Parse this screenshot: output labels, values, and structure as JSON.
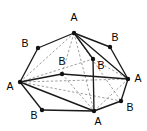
{
  "figure": {
    "width": 147,
    "height": 131,
    "background_color": "#ffffff",
    "solid_edge_color": "#1a1a1a",
    "dashed_edge_color": "#8c8c8c",
    "node_color": "#111111",
    "label_color": "#000000"
  },
  "vertices": [
    {
      "id": "A_top",
      "label": "A",
      "x": 74,
      "y": 33,
      "label_x": 74,
      "label_y": 18,
      "site": "A",
      "position": "top"
    },
    {
      "id": "B_upleft",
      "label": "B",
      "x": 38,
      "y": 48,
      "label_x": 25,
      "label_y": 44,
      "site": "B",
      "position": "upper-left"
    },
    {
      "id": "B_upright",
      "label": "B",
      "x": 110,
      "y": 47,
      "label_x": 115,
      "label_y": 38,
      "site": "B",
      "position": "upper-right"
    },
    {
      "id": "A_left",
      "label": "A",
      "x": 20,
      "y": 82,
      "label_x": 10,
      "label_y": 87,
      "site": "A",
      "position": "left"
    },
    {
      "id": "A_right",
      "label": "A",
      "x": 128,
      "y": 79,
      "label_x": 138,
      "label_y": 79,
      "site": "A",
      "position": "right"
    },
    {
      "id": "B_inleft",
      "label": "B",
      "x": 62,
      "y": 74,
      "label_x": 62,
      "label_y": 62,
      "site": "B",
      "position": "interior-left"
    },
    {
      "id": "B_inright",
      "label": "B",
      "x": 93,
      "y": 59,
      "label_x": 101,
      "label_y": 66,
      "site": "B",
      "position": "interior-right"
    },
    {
      "id": "B_lowleft",
      "label": "B",
      "x": 42,
      "y": 110,
      "label_x": 34,
      "label_y": 116,
      "site": "B",
      "position": "lower-left"
    },
    {
      "id": "A_bottom",
      "label": "A",
      "x": 94,
      "y": 111,
      "label_x": 98,
      "label_y": 122,
      "site": "A",
      "position": "bottom"
    },
    {
      "id": "B_lowright",
      "label": "B",
      "x": 121,
      "y": 101,
      "label_x": 130,
      "label_y": 108,
      "site": "B",
      "position": "lower-right"
    }
  ],
  "edges_solid": [
    {
      "from": "A_top",
      "to": "B_upleft"
    },
    {
      "from": "A_top",
      "to": "B_upright"
    },
    {
      "from": "B_upleft",
      "to": "A_left"
    },
    {
      "from": "B_upright",
      "to": "A_right"
    },
    {
      "from": "A_left",
      "to": "B_lowleft"
    },
    {
      "from": "B_lowleft",
      "to": "A_bottom"
    },
    {
      "from": "A_bottom",
      "to": "B_lowright"
    },
    {
      "from": "B_lowright",
      "to": "A_right"
    },
    {
      "from": "A_left",
      "to": "B_inleft"
    },
    {
      "from": "B_inleft",
      "to": "A_right"
    },
    {
      "from": "A_top",
      "to": "B_inright"
    },
    {
      "from": "B_inright",
      "to": "A_bottom"
    },
    {
      "from": "A_left",
      "to": "A_bottom"
    },
    {
      "from": "A_top",
      "to": "A_right"
    }
  ],
  "edges_dashed": [
    {
      "from": "A_top",
      "to": "A_left"
    },
    {
      "from": "A_top",
      "to": "B_inleft"
    },
    {
      "from": "A_top",
      "to": "A_bottom"
    },
    {
      "from": "A_top",
      "to": "B_lowright"
    },
    {
      "from": "A_left",
      "to": "B_inright"
    },
    {
      "from": "A_left",
      "to": "A_right"
    },
    {
      "from": "A_left",
      "to": "B_lowright"
    },
    {
      "from": "B_inleft",
      "to": "A_bottom"
    },
    {
      "from": "B_inright",
      "to": "A_right"
    },
    {
      "from": "A_right",
      "to": "A_bottom"
    }
  ],
  "legend": {
    "site_a_label": "A",
    "site_b_label": "B"
  }
}
